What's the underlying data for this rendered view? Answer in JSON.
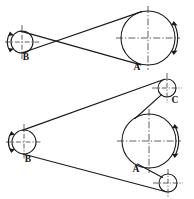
{
  "drawing": {
    "title": "Belt drive arrangements",
    "background_color": "#ffffff",
    "line_color": "#1a1a1a",
    "centerline_color": "#2b2b2b",
    "figures": [
      {
        "id": "figure-top",
        "type": "crossed-belt-drive",
        "description": "Crossed belt drive between driver pulley B and driven pulley A",
        "pulleys": [
          {
            "label": "B",
            "role": "small-pulley",
            "cx": 22,
            "cy": 42,
            "r": 11,
            "label_x": 26,
            "label_y": 58,
            "rotation_arrow_side": "left"
          },
          {
            "label": "A",
            "role": "large-pulley",
            "cx": 148,
            "cy": 38,
            "r": 27,
            "label_x": 137,
            "label_y": 68,
            "rotation_arrow_side": "right"
          }
        ],
        "belt": {
          "style": "crossed",
          "crossing_point_x": 57,
          "crossing_point_y": 40
        }
      },
      {
        "id": "figure-bottom",
        "type": "open-belt-drive-with-idlers",
        "description": "Open belt drive between pulley B and pulley A guided by idler pulleys C and lower idler",
        "pulleys": [
          {
            "label": "B",
            "role": "small-pulley",
            "cx": 24,
            "cy": 142,
            "r": 12,
            "label_x": 28,
            "label_y": 160,
            "rotation_arrow_side": "left"
          },
          {
            "label": "A",
            "role": "large-pulley",
            "cx": 149,
            "cy": 141,
            "r": 27,
            "label_x": 136,
            "label_y": 170,
            "rotation_arrow_side": "right"
          },
          {
            "label": "C",
            "role": "idler-pulley-upper",
            "cx": 167,
            "cy": 88,
            "r": 9,
            "label_x": 175,
            "label_y": 101,
            "rotation_arrow_side": "none"
          },
          {
            "label": "",
            "role": "idler-pulley-lower",
            "cx": 168,
            "cy": 183,
            "r": 9,
            "label_x": 0,
            "label_y": 0,
            "rotation_arrow_side": "none"
          }
        ],
        "belt": {
          "style": "open-with-idlers",
          "crossing_point_x": 0,
          "crossing_point_y": 0
        }
      }
    ],
    "labels": [
      {
        "name": "label-b-top",
        "text": "B",
        "x": 26,
        "y": 58
      },
      {
        "name": "label-a-top",
        "text": "A",
        "x": 137,
        "y": 68
      },
      {
        "name": "label-c-bottom",
        "text": "C",
        "x": 175,
        "y": 101
      },
      {
        "name": "label-b-bottom",
        "text": "B",
        "x": 28,
        "y": 160
      },
      {
        "name": "label-a-bottom",
        "text": "A",
        "x": 136,
        "y": 170
      }
    ]
  }
}
